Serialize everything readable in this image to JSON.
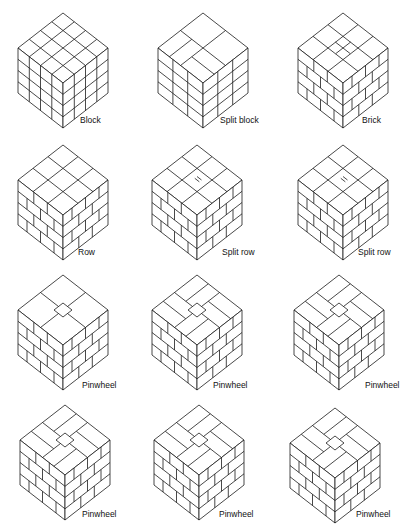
{
  "figure": {
    "rows": [
      {
        "items": [
          {
            "label": "Block",
            "pattern": "block"
          },
          {
            "label": "Split block",
            "pattern": "split-block"
          },
          {
            "label": "Brick",
            "pattern": "brick"
          }
        ]
      },
      {
        "items": [
          {
            "label": "Row",
            "pattern": "row"
          },
          {
            "label": "Split row",
            "pattern": "split-row-a"
          },
          {
            "label": "Split row",
            "pattern": "split-row-b"
          }
        ]
      },
      {
        "items": [
          {
            "label": "Pinwheel",
            "pattern": "pinwheel-a"
          },
          {
            "label": "Pinwheel",
            "pattern": "pinwheel-b"
          },
          {
            "label": "Pinwheel",
            "pattern": "pinwheel-c"
          }
        ]
      },
      {
        "items": [
          {
            "label": "Pinwheel",
            "pattern": "pinwheel-d"
          },
          {
            "label": "Pinwheel",
            "pattern": "pinwheel-e"
          },
          {
            "label": "Pinwheel",
            "pattern": "pinwheel-f"
          }
        ]
      }
    ]
  }
}
